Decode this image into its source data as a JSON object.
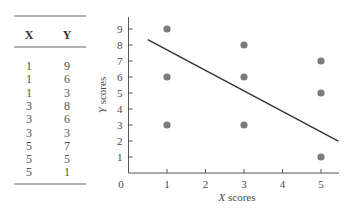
{
  "table": {
    "headers": [
      "X",
      "Y"
    ],
    "rows": [
      [
        "1",
        "9"
      ],
      [
        "1",
        "6"
      ],
      [
        "1",
        "3"
      ],
      [
        "3",
        "8"
      ],
      [
        "3",
        "6"
      ],
      [
        "3",
        "3"
      ],
      [
        "5",
        "7"
      ],
      [
        "5",
        "5"
      ],
      [
        "5",
        "1"
      ]
    ]
  },
  "chart_data": {
    "type": "scatter",
    "title": "",
    "xlabel": "X scores",
    "ylabel": "Y scores",
    "xlim": [
      0,
      5.5
    ],
    "ylim": [
      0,
      9.5
    ],
    "x_ticks": [
      1,
      2,
      3,
      4,
      5
    ],
    "y_ticks": [
      1,
      2,
      3,
      4,
      5,
      6,
      7,
      8,
      9
    ],
    "origin_label": "0",
    "grid": false,
    "legend": null,
    "series": [
      {
        "name": "scores",
        "points": [
          {
            "x": 1,
            "y": 9
          },
          {
            "x": 1,
            "y": 6
          },
          {
            "x": 1,
            "y": 3
          },
          {
            "x": 3,
            "y": 8
          },
          {
            "x": 3,
            "y": 6
          },
          {
            "x": 3,
            "y": 3
          },
          {
            "x": 5,
            "y": 7
          },
          {
            "x": 5,
            "y": 5
          },
          {
            "x": 5,
            "y": 1
          }
        ],
        "color": "#7a7a7a"
      }
    ],
    "regression_line": {
      "x_start": 0.5,
      "y_start": 8.33,
      "x_end": 5.45,
      "y_end": 1.99,
      "slope": -1.0,
      "intercept": 8.0,
      "color": "#333333"
    }
  },
  "colors": {
    "axis": "#555555",
    "text": "#4a4a4a",
    "point": "#7a7a7a",
    "line": "#333333",
    "rule": "#666666"
  }
}
